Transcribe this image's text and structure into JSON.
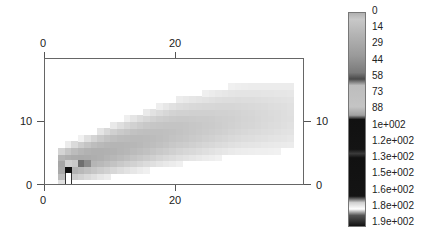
{
  "chart_data": {
    "type": "heatmap",
    "title": "",
    "xlabel": "",
    "ylabel": "",
    "xlim": [
      0,
      39.7
    ],
    "ylim": [
      0,
      19.8
    ],
    "grid": false,
    "x_ticks": [
      0,
      20
    ],
    "y_ticks": [
      0,
      10
    ],
    "x_tick_labels_top": [
      "0",
      "20"
    ],
    "x_tick_labels_bottom": [
      "0",
      "20"
    ],
    "y_tick_labels_left": [
      "0",
      "10"
    ],
    "y_tick_labels_right": [
      "0",
      "10"
    ],
    "cell_size": 1,
    "colorbar": {
      "position": "right",
      "min": 0,
      "max": 190,
      "tick_labels": [
        "0",
        "14",
        "29",
        "44",
        "58",
        "73",
        "88",
        "1e+002",
        "1.2e+002",
        "1.3e+002",
        "1.5e+002",
        "1.6e+002",
        "1.8e+002",
        "1.9e+002"
      ],
      "stops": [
        {
          "pos": 0.0,
          "color": "#b0b0b0"
        },
        {
          "pos": 0.03,
          "color": "#c8c8c8"
        },
        {
          "pos": 0.1,
          "color": "#b4b4b4"
        },
        {
          "pos": 0.2,
          "color": "#9a9a9a"
        },
        {
          "pos": 0.28,
          "color": "#7a7a7a"
        },
        {
          "pos": 0.31,
          "color": "#4a4a4a"
        },
        {
          "pos": 0.34,
          "color": "#bdbdbd"
        },
        {
          "pos": 0.44,
          "color": "#c4c4c4"
        },
        {
          "pos": 0.48,
          "color": "#a0a0a0"
        },
        {
          "pos": 0.5,
          "color": "#111111"
        },
        {
          "pos": 0.64,
          "color": "#141414"
        },
        {
          "pos": 0.66,
          "color": "#3a3a3a"
        },
        {
          "pos": 0.68,
          "color": "#111111"
        },
        {
          "pos": 0.86,
          "color": "#141414"
        },
        {
          "pos": 0.89,
          "color": "#d0d0d0"
        },
        {
          "pos": 0.92,
          "color": "#ffffff"
        },
        {
          "pos": 0.95,
          "color": "#555555"
        },
        {
          "pos": 1.0,
          "color": "#111111"
        }
      ]
    },
    "band_model": {
      "description": "Density band rising from origin region toward upper right; values decrease away from centre line",
      "x_extent": [
        2,
        38
      ],
      "centre_line": [
        [
          2,
          3
        ],
        [
          10,
          5.5
        ],
        [
          20,
          8.5
        ],
        [
          30,
          10.5
        ],
        [
          38,
          11
        ]
      ],
      "half_width": [
        [
          2,
          2.5
        ],
        [
          10,
          3.5
        ],
        [
          20,
          4.5
        ],
        [
          38,
          5
        ]
      ],
      "peak_value_near_origin": 40,
      "peak_value_far": 10
    },
    "highlight_cells": [
      {
        "x": 3,
        "y": 2,
        "value": 190,
        "color": "#111111"
      },
      {
        "x": 3,
        "y": 1,
        "value": 180,
        "color": "#ffffff"
      },
      {
        "x": 3,
        "y": 0,
        "value": 180,
        "color": "#ffffff"
      },
      {
        "x": 4,
        "y": 3,
        "value": 88,
        "color": "#c9c9c9"
      },
      {
        "x": 3,
        "y": 3,
        "value": 88,
        "color": "#d0d0d0"
      },
      {
        "x": 5,
        "y": 3,
        "value": 55,
        "color": "#6e6e6e"
      },
      {
        "x": 6,
        "y": 3,
        "value": 45,
        "color": "#8a8a8a"
      }
    ]
  }
}
